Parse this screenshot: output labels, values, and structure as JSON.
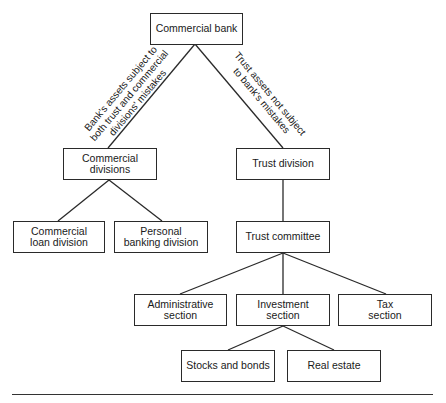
{
  "diagram": {
    "type": "org-chart",
    "nodes": {
      "commercial_bank": "Commercial bank",
      "commercial_divisions": "Commercial divisions",
      "trust_division": "Trust division",
      "commercial_loan_division": "Commercial\nloan division",
      "personal_banking_division": "Personal\nbanking division",
      "trust_committee": "Trust committee",
      "administrative_section": "Administrative\nsection",
      "investment_section": "Investment\nsection",
      "tax_section": "Tax\nsection",
      "stocks_and_bonds": "Stocks and bonds",
      "real_estate": "Real estate"
    },
    "edge_labels": {
      "bank_to_commercial": "Bank's assets subject to\nboth trust and commercial\ndivisions' mistakes",
      "bank_to_trust": "Trust assets not subject\nto bank's mistakes"
    },
    "edges": [
      [
        "commercial_bank",
        "commercial_divisions"
      ],
      [
        "commercial_bank",
        "trust_division"
      ],
      [
        "commercial_divisions",
        "commercial_loan_division"
      ],
      [
        "commercial_divisions",
        "personal_banking_division"
      ],
      [
        "trust_division",
        "trust_committee"
      ],
      [
        "trust_committee",
        "administrative_section"
      ],
      [
        "trust_committee",
        "investment_section"
      ],
      [
        "trust_committee",
        "tax_section"
      ],
      [
        "investment_section",
        "stocks_and_bonds"
      ],
      [
        "investment_section",
        "real_estate"
      ]
    ]
  }
}
